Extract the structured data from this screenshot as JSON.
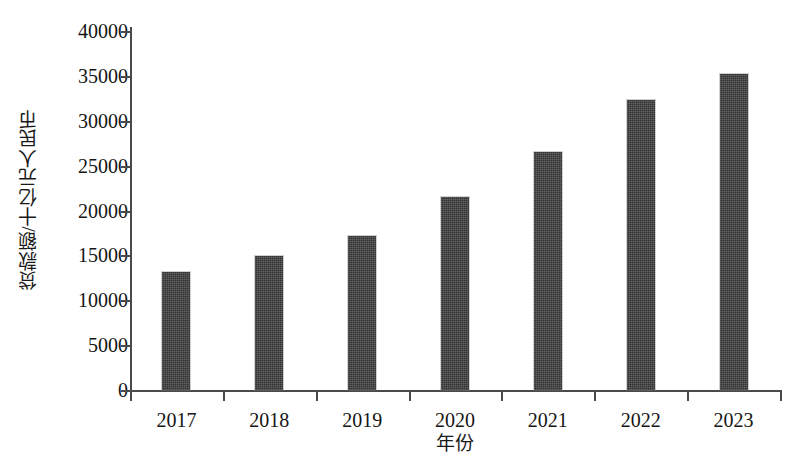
{
  "chart_data": {
    "type": "bar",
    "title": "",
    "subtitle": "",
    "xlabel": "年份",
    "ylabel": "贷款额/十亿元人民币",
    "categories": [
      "2017",
      "2018",
      "2019",
      "2020",
      "2021",
      "2022",
      "2023"
    ],
    "values": [
      13100,
      14900,
      17200,
      21500,
      26500,
      32300,
      35200
    ],
    "series": [
      {
        "name": "贷款额",
        "values": [
          13100,
          14900,
          17200,
          21500,
          26500,
          32300,
          35200
        ]
      }
    ],
    "ylim": [
      0,
      40000
    ],
    "ytick_labels": [
      "0",
      "5000",
      "10000",
      "15000",
      "20000",
      "25000",
      "30000",
      "35000",
      "40000"
    ],
    "ytick_values": [
      0,
      5000,
      10000,
      15000,
      20000,
      25000,
      30000,
      35000,
      40000
    ],
    "grid": false,
    "legend": false,
    "legend_position": "none",
    "bar_color": "#3e3e3e",
    "axis_color": "#4a4a4a",
    "background_color": "#ffffff",
    "annotations": []
  }
}
